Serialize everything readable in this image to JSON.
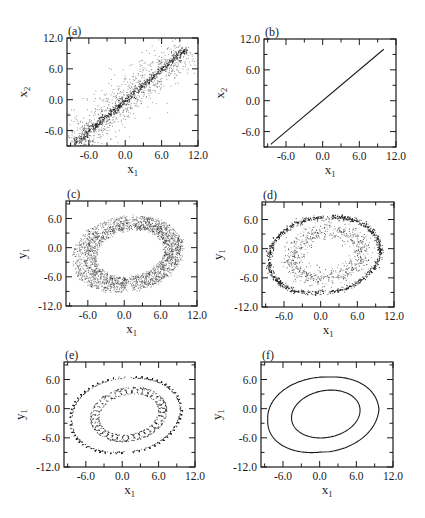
{
  "figure": {
    "background": "#ffffff",
    "ink": "#1a1a1a"
  },
  "chart_data": [
    {
      "id": "a",
      "panel_label": "(a)",
      "type": "scatter",
      "xlabel": "x",
      "xlabel_sub": "1",
      "ylabel": "x",
      "ylabel_sub": "2",
      "xlim": [
        -9.6,
        12.0
      ],
      "ylim": [
        -9.0,
        12.0
      ],
      "xticks": [
        -6.0,
        0.0,
        6.0,
        12.0
      ],
      "xtick_labels": [
        "-6.0",
        "0.0",
        "6.0",
        "12.0"
      ],
      "yticks": [
        -6.0,
        0.0,
        6.0,
        12.0
      ],
      "ytick_labels": [
        "-6.0",
        "0.0",
        "6.0",
        "12.0"
      ],
      "minor_step": 3.0,
      "frame_px": {
        "x": 67,
        "y": 38,
        "w": 131,
        "h": 108
      },
      "description": "Dense scatter of points concentrated along the diagonal x2 = x1 from about -8.5 to 10, with a wide cloud of spread (about ±4) around it.",
      "diagonal_range": [
        -8.5,
        10.0
      ],
      "spread": 4.0,
      "n_points": 1600
    },
    {
      "id": "b",
      "panel_label": "(b)",
      "type": "line",
      "xlabel": "x",
      "xlabel_sub": "1",
      "ylabel": "x",
      "ylabel_sub": "2",
      "xlim": [
        -9.6,
        12.0
      ],
      "ylim": [
        -9.0,
        12.0
      ],
      "xticks": [
        -6.0,
        0.0,
        6.0,
        12.0
      ],
      "xtick_labels": [
        "-6.0",
        "0.0",
        "6.0",
        "12.0"
      ],
      "yticks": [
        -6.0,
        0.0,
        6.0,
        12.0
      ],
      "ytick_labels": [
        "-6.0",
        "0.0",
        "6.0",
        "12.0"
      ],
      "minor_step": 3.0,
      "frame_px": {
        "x": 264,
        "y": 39,
        "w": 132,
        "h": 108
      },
      "series": [
        {
          "name": "synchronization line",
          "x": [
            -8.5,
            10.0
          ],
          "y": [
            -8.5,
            10.0
          ]
        }
      ]
    },
    {
      "id": "c",
      "panel_label": "(c)",
      "type": "scatter",
      "xlabel": "x",
      "xlabel_sub": "1",
      "ylabel": "y",
      "ylabel_sub": "1",
      "xlim": [
        -9.6,
        12.0
      ],
      "ylim": [
        -12.0,
        9.6
      ],
      "xticks": [
        -6.0,
        0.0,
        6.0,
        12.0
      ],
      "xtick_labels": [
        "-6.0",
        "0.0",
        "6.0",
        "12.0"
      ],
      "yticks": [
        -12.0,
        -6.0,
        0.0,
        6.0
      ],
      "ytick_labels": [
        "-12.0",
        "-6.0",
        "0.0",
        "6.0"
      ],
      "minor_step": 3.0,
      "frame_px": {
        "x": 66,
        "y": 201,
        "w": 131,
        "h": 105
      },
      "description": "Chaotic attractor filling a thick annular band between inner and outer loops.",
      "style": "filled-band",
      "n_points": 2600
    },
    {
      "id": "d",
      "panel_label": "(d)",
      "type": "scatter",
      "xlabel": "x",
      "xlabel_sub": "1",
      "ylabel": "y",
      "ylabel_sub": "1",
      "xlim": [
        -9.6,
        12.0
      ],
      "ylim": [
        -12.0,
        9.6
      ],
      "xticks": [
        -6.0,
        0.0,
        6.0,
        12.0
      ],
      "xtick_labels": [
        "-6.0",
        "0.0",
        "6.0",
        "12.0"
      ],
      "yticks": [
        -12.0,
        -6.0,
        0.0,
        6.0
      ],
      "ytick_labels": [
        "-12.0",
        "-6.0",
        "0.0",
        "6.0"
      ],
      "minor_step": 3.0,
      "frame_px": {
        "x": 262,
        "y": 202,
        "w": 132,
        "h": 105
      },
      "description": "Attractor concentrated on a dense outer loop and a fuzzier inner loop band.",
      "style": "two-bands",
      "n_points": 2200
    },
    {
      "id": "e",
      "panel_label": "(e)",
      "type": "scatter",
      "xlabel": "x",
      "xlabel_sub": "1",
      "ylabel": "y",
      "ylabel_sub": "1",
      "xlim": [
        -9.6,
        12.0
      ],
      "ylim": [
        -12.0,
        9.6
      ],
      "xticks": [
        -6.0,
        0.0,
        6.0,
        12.0
      ],
      "xtick_labels": [
        "-6.0",
        "0.0",
        "6.0",
        "12.0"
      ],
      "yticks": [
        -12.0,
        -6.0,
        0.0,
        6.0
      ],
      "ytick_labels": [
        "-12.0",
        "-6.0",
        "0.0",
        "6.0"
      ],
      "minor_step": 3.0,
      "frame_px": {
        "x": 64,
        "y": 362,
        "w": 131,
        "h": 105
      },
      "description": "Thin outer loop traced with small oscillations, and a coiled (helical) inner loop.",
      "style": "coiled",
      "n_points": 1400
    },
    {
      "id": "f",
      "panel_label": "(f)",
      "type": "line",
      "xlabel": "x",
      "xlabel_sub": "1",
      "ylabel": "y",
      "ylabel_sub": "1",
      "xlim": [
        -9.6,
        12.0
      ],
      "ylim": [
        -12.0,
        9.6
      ],
      "xticks": [
        -6.0,
        0.0,
        6.0,
        12.0
      ],
      "xtick_labels": [
        "-6.0",
        "0.0",
        "6.0",
        "12.0"
      ],
      "yticks": [
        -12.0,
        -6.0,
        0.0,
        6.0
      ],
      "ytick_labels": [
        "-12.0",
        "-6.0",
        "0.0",
        "6.0"
      ],
      "minor_step": 3.0,
      "frame_px": {
        "x": 261,
        "y": 362,
        "w": 132,
        "h": 105
      },
      "description": "Clean period-2 limit cycle: two nested loops crossing near (6, 2).",
      "style": "clean",
      "series": [
        {
          "name": "outer loop",
          "x_extent": [
            -8.5,
            9.8
          ],
          "y_extent": [
            -9.0,
            6.6
          ]
        },
        {
          "name": "inner loop",
          "x_extent": [
            -4.6,
            6.6
          ],
          "y_extent": [
            -6.0,
            3.8
          ]
        }
      ]
    }
  ]
}
